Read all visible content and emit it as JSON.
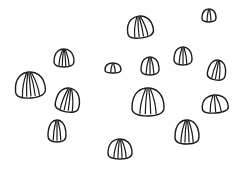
{
  "scene": {
    "description": "Hand-drawn line sketch of scattered striped shell-like shapes on a white background",
    "background_color": "#ffffff",
    "stroke_color": "#1a1a1a",
    "shape_count": 14
  },
  "shapes": [
    {
      "cx": 140,
      "cy": 27,
      "w": 26,
      "h": 22,
      "rot": -8,
      "stripes": 4
    },
    {
      "cx": 209,
      "cy": 15,
      "w": 14,
      "h": 13,
      "rot": 0,
      "stripes": 2
    },
    {
      "cx": 64,
      "cy": 58,
      "w": 20,
      "h": 18,
      "rot": 0,
      "stripes": 4
    },
    {
      "cx": 113,
      "cy": 68,
      "w": 16,
      "h": 10,
      "rot": 0,
      "stripes": 2
    },
    {
      "cx": 150,
      "cy": 66,
      "w": 18,
      "h": 18,
      "rot": 0,
      "stripes": 3
    },
    {
      "cx": 183,
      "cy": 56,
      "w": 18,
      "h": 18,
      "rot": 0,
      "stripes": 3
    },
    {
      "cx": 217,
      "cy": 70,
      "w": 18,
      "h": 20,
      "rot": 10,
      "stripes": 3
    },
    {
      "cx": 30,
      "cy": 85,
      "w": 30,
      "h": 26,
      "rot": -5,
      "stripes": 5
    },
    {
      "cx": 68,
      "cy": 100,
      "w": 24,
      "h": 24,
      "rot": 10,
      "stripes": 4
    },
    {
      "cx": 148,
      "cy": 102,
      "w": 32,
      "h": 28,
      "rot": 0,
      "stripes": 4
    },
    {
      "cx": 215,
      "cy": 104,
      "w": 26,
      "h": 18,
      "rot": -5,
      "stripes": 3
    },
    {
      "cx": 57,
      "cy": 131,
      "w": 18,
      "h": 22,
      "rot": 0,
      "stripes": 3
    },
    {
      "cx": 120,
      "cy": 149,
      "w": 24,
      "h": 20,
      "rot": 0,
      "stripes": 4
    },
    {
      "cx": 187,
      "cy": 132,
      "w": 24,
      "h": 24,
      "rot": 0,
      "stripes": 4
    }
  ]
}
